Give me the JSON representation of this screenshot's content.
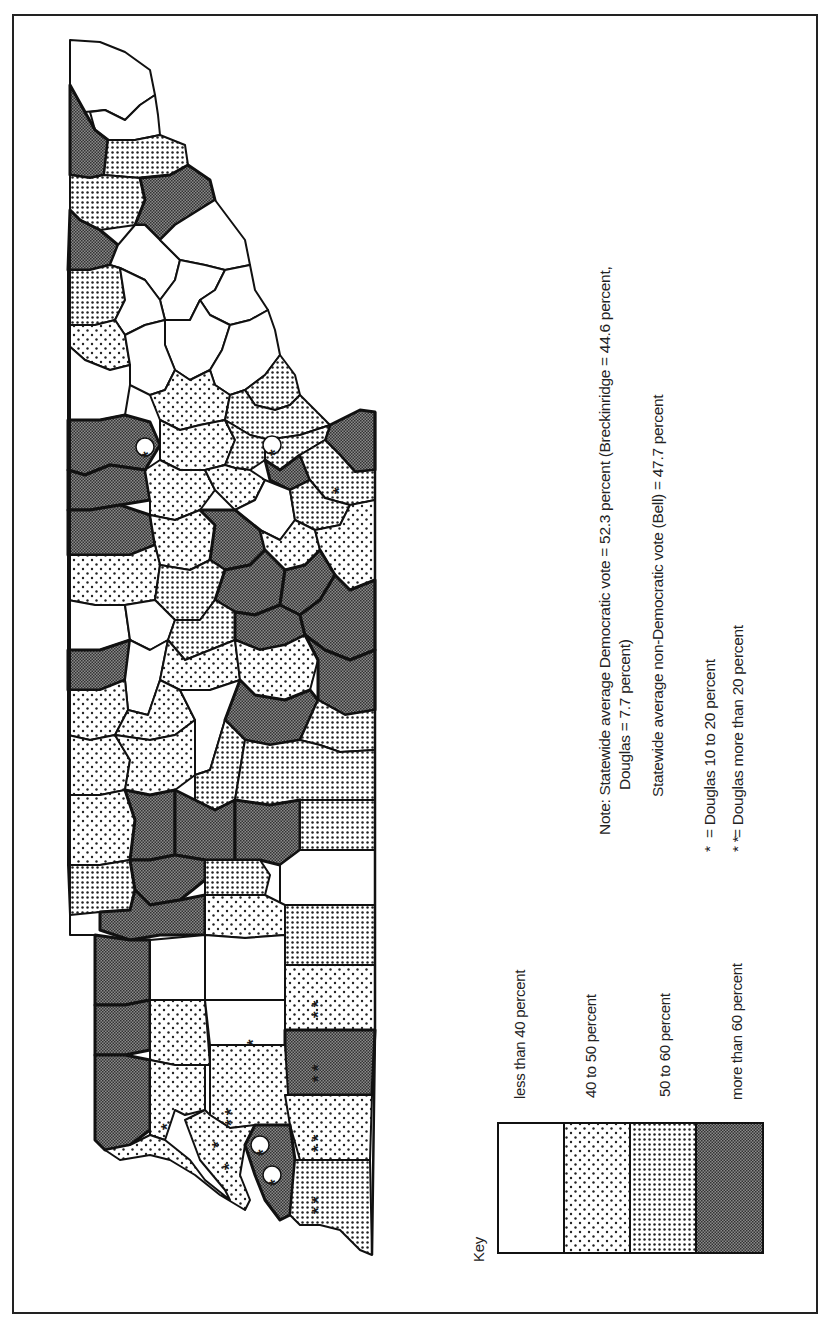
{
  "figure": {
    "key": {
      "title": "Key",
      "items": [
        {
          "label": "less than 40 percent",
          "pattern": "white"
        },
        {
          "label": "40 to  50 percent",
          "pattern": "sparse-dots"
        },
        {
          "label": "50 to 60 percent",
          "pattern": "dense-dots"
        },
        {
          "label": "more than 60 percent",
          "pattern": "dark-checker"
        }
      ]
    },
    "note": {
      "line1": "Note: Statewide average Democratic vote = 52.3 percent (Breckinridge = 44.6 percent,",
      "line2": "Douglas = 7.7 percent)",
      "line3": "Statewide average non-Democratic vote (Bell) = 47.7 percent"
    },
    "symbols": [
      {
        "glyph": "*",
        "label": "= Douglas 10 to 20 percent"
      },
      {
        "glyph": "* *",
        "label": "= Douglas more than 20 percent"
      }
    ],
    "stats": {
      "democratic_total_pct": 52.3,
      "breckinridge_pct": 44.6,
      "douglas_pct": 7.7,
      "bell_pct": 47.7
    },
    "colors": {
      "ink": "#1a1a1a",
      "paper": "#ffffff"
    }
  }
}
